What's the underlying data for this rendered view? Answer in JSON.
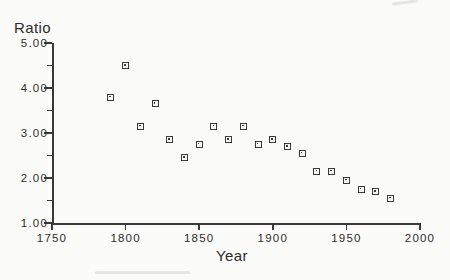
{
  "figure": {
    "background": "#fbfbf9",
    "ink_color": "#3a3a3a",
    "text_color": "#2b2b2b"
  },
  "chart_data": {
    "type": "scatter",
    "title": "",
    "ylabel": "Ratio",
    "xlabel": "Year",
    "marker": "square-outline-with-center-dot",
    "grid": false,
    "legend": "none",
    "xlim": [
      1750,
      2000
    ],
    "ylim": [
      1.0,
      5.0
    ],
    "x_ticks": [
      1750,
      1800,
      1850,
      1900,
      1950,
      2000
    ],
    "x_tick_labels": [
      "1750",
      "1800",
      "1850",
      "1900",
      "1950",
      "2000"
    ],
    "y_ticks": [
      1,
      2,
      3,
      4,
      5
    ],
    "y_tick_labels": [
      "1.00",
      "2.00",
      "3.00",
      "4.00",
      "5.00"
    ],
    "y_minor_ticks": [
      1.5,
      2.5,
      3.5,
      4.5
    ],
    "series": [
      {
        "name": "ratio-by-year",
        "x": [
          1790,
          1800,
          1810,
          1820,
          1830,
          1840,
          1850,
          1860,
          1870,
          1880,
          1890,
          1900,
          1910,
          1920,
          1930,
          1940,
          1950,
          1960,
          1970,
          1980
        ],
        "y": [
          3.8,
          4.5,
          3.15,
          3.65,
          2.85,
          2.45,
          2.75,
          3.15,
          2.85,
          3.15,
          2.75,
          2.85,
          2.7,
          2.55,
          2.15,
          2.15,
          1.95,
          1.75,
          1.7,
          1.55
        ]
      }
    ]
  }
}
